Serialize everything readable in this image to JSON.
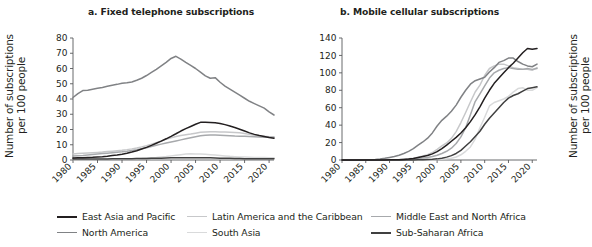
{
  "figure": {
    "width": 549,
    "height": 247
  },
  "panels": [
    {
      "id": "a",
      "title": "a. Fixed telephone subscriptions",
      "ylabel": "Number of subscriptions\nper 100 people"
    },
    {
      "id": "b",
      "title": "b. Mobile cellular subscriptions",
      "ylabel": "Number of subscriptions\nper 100 people"
    }
  ],
  "legend": {
    "items": [
      {
        "label": "East Asia and Pacific",
        "color": "#231f20",
        "row": 1,
        "col": 1
      },
      {
        "label": "Latin America and the Caribbean",
        "color": "#c7c8ca",
        "row": 1,
        "col": 2
      },
      {
        "label": "Middle East and North Africa",
        "color": "#a7a9ac",
        "row": 1,
        "col": 3
      },
      {
        "label": "North America",
        "color": "#808285",
        "row": 2,
        "col": 1
      },
      {
        "label": "South Asia",
        "color": "#d9dadb",
        "row": 2,
        "col": 2
      },
      {
        "label": "Sub-Saharan Africa",
        "color": "#404040",
        "row": 2,
        "col": 3
      }
    ]
  },
  "chart_data": [
    {
      "type": "line",
      "panel": "a",
      "title": "a. Fixed telephone subscriptions",
      "xlabel": "",
      "ylabel": "Number of subscriptions per 100 people",
      "xlim": [
        1980,
        2021
      ],
      "ylim": [
        0,
        80
      ],
      "yticks": [
        0,
        10,
        20,
        30,
        40,
        50,
        60,
        70,
        80
      ],
      "xticks": [
        1980,
        1985,
        1990,
        1995,
        2000,
        2005,
        2010,
        2015,
        2020
      ],
      "grid": false,
      "legend_position": "below-figure",
      "x": [
        1980,
        1981,
        1982,
        1983,
        1984,
        1985,
        1986,
        1987,
        1988,
        1989,
        1990,
        1991,
        1992,
        1993,
        1994,
        1995,
        1996,
        1997,
        1998,
        1999,
        2000,
        2001,
        2002,
        2003,
        2004,
        2005,
        2006,
        2007,
        2008,
        2009,
        2010,
        2011,
        2012,
        2013,
        2014,
        2015,
        2016,
        2017,
        2018,
        2019,
        2020,
        2021
      ],
      "series": [
        {
          "name": "North America",
          "color": "#808285",
          "values": [
            41.0,
            43.5,
            45.5,
            45.8,
            46.4,
            47.0,
            47.6,
            48.3,
            49.0,
            49.6,
            50.3,
            50.6,
            51.2,
            52.3,
            53.6,
            55.4,
            57.4,
            59.4,
            61.7,
            64.0,
            66.6,
            68.0,
            66.2,
            64.0,
            62.0,
            60.0,
            57.6,
            55.2,
            53.6,
            54.0,
            51.0,
            48.5,
            46.5,
            44.5,
            42.5,
            40.5,
            38.5,
            37.0,
            35.5,
            34.0,
            31.5,
            29.5
          ]
        },
        {
          "name": "East Asia and Pacific",
          "color": "#231f20",
          "values": [
            1.3,
            1.4,
            1.5,
            1.7,
            1.8,
            2.0,
            2.2,
            2.5,
            2.9,
            3.3,
            3.8,
            4.4,
            5.2,
            6.1,
            7.2,
            8.3,
            9.6,
            11.0,
            12.4,
            13.9,
            15.5,
            17.2,
            19.0,
            20.6,
            22.0,
            23.4,
            24.7,
            24.8,
            24.6,
            24.4,
            24.0,
            23.2,
            22.3,
            21.3,
            20.2,
            19.0,
            17.8,
            16.8,
            16.0,
            15.4,
            14.8,
            14.3
          ]
        },
        {
          "name": "Latin America and the Caribbean",
          "color": "#c7c8ca",
          "values": [
            4.0,
            4.2,
            4.4,
            4.6,
            4.8,
            5.0,
            5.2,
            5.5,
            5.8,
            6.1,
            6.4,
            6.8,
            7.3,
            7.9,
            8.6,
            9.4,
            10.3,
            11.4,
            12.5,
            13.6,
            14.6,
            15.4,
            16.0,
            16.5,
            17.0,
            17.6,
            18.2,
            18.4,
            18.5,
            18.5,
            18.4,
            18.3,
            18.2,
            18.0,
            17.8,
            17.4,
            16.8,
            16.2,
            15.8,
            15.6,
            15.3,
            15.2
          ]
        },
        {
          "name": "Middle East and North Africa",
          "color": "#a7a9ac",
          "values": [
            2.6,
            2.8,
            3.0,
            3.3,
            3.6,
            3.9,
            4.2,
            4.5,
            4.8,
            5.1,
            5.4,
            5.8,
            6.3,
            6.8,
            7.4,
            8.1,
            8.9,
            9.7,
            10.4,
            11.1,
            11.8,
            12.5,
            13.2,
            13.9,
            14.6,
            15.3,
            15.9,
            16.2,
            16.4,
            16.4,
            16.3,
            16.1,
            15.9,
            15.7,
            15.6,
            15.5,
            15.4,
            15.3,
            15.1,
            15.0,
            14.9,
            14.8
          ]
        },
        {
          "name": "South Asia",
          "color": "#d9dadb",
          "values": [
            0.3,
            0.3,
            0.3,
            0.4,
            0.4,
            0.5,
            0.5,
            0.6,
            0.6,
            0.7,
            0.7,
            0.8,
            0.9,
            1.0,
            1.1,
            1.3,
            1.5,
            1.7,
            2.0,
            2.3,
            2.7,
            3.1,
            3.5,
            3.9,
            4.1,
            4.0,
            3.9,
            3.7,
            3.5,
            3.3,
            3.0,
            2.7,
            2.4,
            2.2,
            2.0,
            1.9,
            1.8,
            1.7,
            1.6,
            1.6,
            1.5,
            1.5
          ]
        },
        {
          "name": "Sub-Saharan Africa",
          "color": "#404040",
          "values": [
            0.6,
            0.6,
            0.6,
            0.6,
            0.7,
            0.7,
            0.7,
            0.7,
            0.8,
            0.8,
            0.9,
            0.9,
            0.9,
            1.0,
            1.0,
            1.0,
            1.1,
            1.1,
            1.2,
            1.3,
            1.4,
            1.4,
            1.5,
            1.5,
            1.5,
            1.5,
            1.5,
            1.4,
            1.4,
            1.3,
            1.2,
            1.1,
            1.1,
            1.0,
            1.0,
            0.9,
            0.9,
            0.9,
            0.8,
            0.8,
            0.8,
            0.8
          ]
        }
      ]
    },
    {
      "type": "line",
      "panel": "b",
      "title": "b. Mobile cellular subscriptions",
      "xlabel": "",
      "ylabel": "Number of subscriptions per 100 people",
      "xlim": [
        1980,
        2021
      ],
      "ylim": [
        0,
        140
      ],
      "yticks": [
        0,
        20,
        40,
        60,
        80,
        100,
        120,
        140
      ],
      "xticks": [
        1980,
        1985,
        1990,
        1995,
        2000,
        2005,
        2010,
        2015,
        2020
      ],
      "grid": false,
      "legend_position": "below-figure",
      "x": [
        1980,
        1981,
        1982,
        1983,
        1984,
        1985,
        1986,
        1987,
        1988,
        1989,
        1990,
        1991,
        1992,
        1993,
        1994,
        1995,
        1996,
        1997,
        1998,
        1999,
        2000,
        2001,
        2002,
        2003,
        2004,
        2005,
        2006,
        2007,
        2008,
        2009,
        2010,
        2011,
        2012,
        2013,
        2014,
        2015,
        2016,
        2017,
        2018,
        2019,
        2020,
        2021
      ],
      "series": [
        {
          "name": "North America",
          "color": "#808285",
          "values": [
            0,
            0,
            0,
            0.05,
            0.1,
            0.2,
            0.4,
            0.7,
            1.2,
            1.9,
            2.9,
            4.0,
            5.5,
            7.4,
            9.9,
            13.0,
            17.0,
            20.7,
            25.1,
            31.1,
            39.0,
            45.5,
            50.3,
            56.0,
            63.0,
            72.0,
            80.0,
            87.0,
            91.0,
            93.0,
            95.0,
            101.0,
            106.0,
            112.0,
            114.0,
            117.0,
            117.0,
            113.0,
            110.0,
            108.0,
            107.0,
            110.0
          ]
        },
        {
          "name": "East Asia and Pacific",
          "color": "#231f20",
          "values": [
            0,
            0,
            0,
            0,
            0,
            0,
            0.01,
            0.02,
            0.04,
            0.08,
            0.15,
            0.25,
            0.4,
            0.7,
            1.1,
            1.8,
            2.8,
            3.9,
            5.1,
            7.0,
            9.6,
            13.0,
            17.0,
            21.5,
            26.0,
            31.0,
            37.0,
            44.0,
            52.0,
            61.0,
            71.0,
            80.0,
            88.0,
            94.0,
            100.0,
            106.0,
            111.0,
            117.0,
            123.0,
            128.0,
            127.0,
            128.0
          ]
        },
        {
          "name": "Latin America and the Caribbean",
          "color": "#c7c8ca",
          "values": [
            0,
            0,
            0,
            0,
            0,
            0,
            0.01,
            0.02,
            0.05,
            0.1,
            0.2,
            0.3,
            0.5,
            0.9,
            1.4,
            2.1,
            3.2,
            4.6,
            6.2,
            8.6,
            12.2,
            16.1,
            19.6,
            24.8,
            32.5,
            43.0,
            54.5,
            66.5,
            78.0,
            86.0,
            97.0,
            105.0,
            108.0,
            110.0,
            110.0,
            108.0,
            106.0,
            105.0,
            104.0,
            104.0,
            103.0,
            106.0
          ]
        },
        {
          "name": "Middle East and North Africa",
          "color": "#a7a9ac",
          "values": [
            0,
            0,
            0,
            0,
            0,
            0,
            0.01,
            0.02,
            0.04,
            0.07,
            0.13,
            0.2,
            0.3,
            0.5,
            0.8,
            1.1,
            1.6,
            2.3,
            3.0,
            4.0,
            5.4,
            7.5,
            10.0,
            13.5,
            19.0,
            26.5,
            37.0,
            52.0,
            67.0,
            76.0,
            85.0,
            94.0,
            100.0,
            103.0,
            105.0,
            106.0,
            105.0,
            104.0,
            104.0,
            105.0,
            104.0,
            105.0
          ]
        },
        {
          "name": "South Asia",
          "color": "#d9dadb",
          "values": [
            0,
            0,
            0,
            0,
            0,
            0,
            0,
            0,
            0,
            0,
            0.01,
            0.01,
            0.02,
            0.03,
            0.05,
            0.08,
            0.12,
            0.2,
            0.3,
            0.4,
            0.6,
            1.0,
            1.4,
            2.1,
            3.4,
            6.0,
            10.0,
            15.0,
            24.0,
            37.0,
            49.0,
            62.0,
            66.0,
            68.0,
            70.0,
            73.0,
            78.0,
            82.0,
            83.0,
            80.0,
            80.0,
            83.0
          ]
        },
        {
          "name": "Sub-Saharan Africa",
          "color": "#404040",
          "values": [
            0,
            0,
            0,
            0,
            0,
            0,
            0,
            0,
            0,
            0.01,
            0.01,
            0.02,
            0.03,
            0.05,
            0.08,
            0.12,
            0.2,
            0.3,
            0.5,
            0.8,
            1.3,
            2.1,
            3.3,
            5.0,
            7.5,
            11.0,
            16.0,
            21.0,
            27.0,
            33.0,
            41.0,
            48.0,
            54.0,
            60.0,
            66.0,
            71.0,
            74.0,
            76.0,
            79.0,
            82.0,
            83.0,
            84.0
          ]
        }
      ]
    }
  ]
}
